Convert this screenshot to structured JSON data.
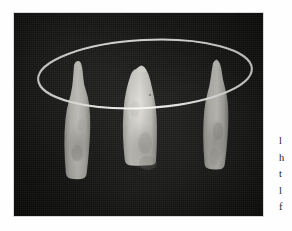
{
  "page": {
    "background_color": "#fefefe",
    "width": 292,
    "height": 231
  },
  "figure": {
    "name": "photograph-dental-specimens",
    "caption": "",
    "plate_color": "#141412",
    "frame": {
      "x": 14,
      "y": 13,
      "width": 249,
      "height": 203
    },
    "annotation": {
      "type": "ellipse-outline",
      "name": "white-ellipse-annotation",
      "color": "#f4f3ee",
      "stroke_width": 2.0,
      "center_x": 145,
      "center_y": 74,
      "radius_x": 107,
      "radius_y": 34,
      "rotation_deg": -3
    },
    "specimens": [
      {
        "label": "left-tooth",
        "position": "left",
        "crown_color": "#c9c8c1",
        "x": 60,
        "y": 62,
        "width": 41,
        "height": 128
      },
      {
        "label": "center-tooth",
        "position": "center",
        "crown_color": "#cfcec7",
        "x": 124,
        "y": 67,
        "width": 45,
        "height": 129
      },
      {
        "label": "right-tooth",
        "position": "right",
        "crown_color": "#c7c6bf",
        "x": 201,
        "y": 61,
        "width": 35,
        "height": 125
      }
    ]
  },
  "margin_text": {
    "name": "clipped-body-text-column",
    "note": "Only the leftmost sliver of each line is visible at the page edge.",
    "lines": [
      "l",
      "h",
      "t",
      "l",
      "f"
    ]
  }
}
